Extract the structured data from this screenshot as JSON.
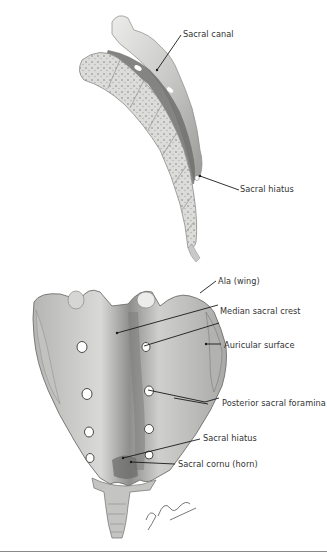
{
  "figure": {
    "lateral_view": {
      "labels": [
        {
          "id": "sacral-canal",
          "text": "Sacral canal"
        },
        {
          "id": "sacral-hiatus-lateral",
          "text": "Sacral hiatus"
        }
      ]
    },
    "posterior_view": {
      "labels": [
        {
          "id": "ala",
          "text": "Ala (wing)"
        },
        {
          "id": "median-sacral-crest",
          "text": "Median sacral crest"
        },
        {
          "id": "auricular-surface",
          "text": "Auricular surface"
        },
        {
          "id": "posterior-sacral-foramina",
          "text": "Posterior sacral foramina"
        },
        {
          "id": "sacral-hiatus-posterior",
          "text": "Sacral hiatus"
        },
        {
          "id": "sacral-cornu",
          "text": "Sacral cornu (horn)"
        }
      ]
    },
    "signature": "F. Netter M.D.",
    "colors": {
      "bone_light": "#e6e6e4",
      "bone_mid": "#bdbdbb",
      "bone_dark": "#7c7c7a",
      "leader_line": "#1a1a1a",
      "label_text": "#333333"
    }
  }
}
